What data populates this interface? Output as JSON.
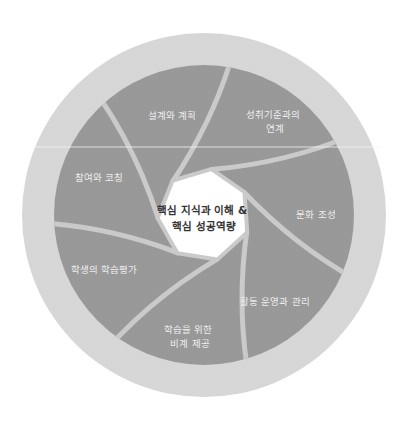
{
  "diagram": {
    "center": {
      "lines": [
        "핵심 지식과 이해 &",
        "핵심 성공역량"
      ]
    },
    "blades": [
      {
        "id": "design-planning",
        "lines": [
          "설계와 계획"
        ]
      },
      {
        "id": "standards-alignment",
        "lines": [
          "성취기준과의",
          "연계"
        ]
      },
      {
        "id": "culture-building",
        "lines": [
          "문화 조성"
        ]
      },
      {
        "id": "activity-management",
        "lines": [
          "활동 운영과 관리"
        ]
      },
      {
        "id": "scaffolding",
        "lines": [
          "학습을 위한",
          "비계 제공"
        ]
      },
      {
        "id": "student-assessment",
        "lines": [
          "학생의 학습평가"
        ]
      },
      {
        "id": "engagement-coaching",
        "lines": [
          "참여와 코칭"
        ]
      }
    ],
    "colors": {
      "outer_ring": "#d6d6d6",
      "blade": "#979797",
      "blade_gap": "#c9c9c9",
      "center": "#ffffff",
      "blade_text": "#eeeeee",
      "center_text": "#333333",
      "scan_line": "#f4f4f4"
    }
  }
}
